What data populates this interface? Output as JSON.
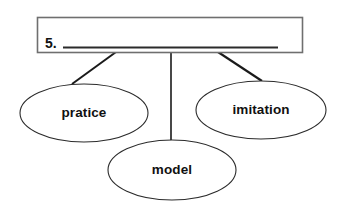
{
  "worksheet": {
    "type": "word-web-diagram",
    "background_color": "#ffffff",
    "line_color": "#1a1a1a",
    "box_border_color": "#6f6f6f",
    "text_color": "#111111",
    "prompt": {
      "number": "5.",
      "answer_blank_value": "",
      "answer_blank_placeholder": "",
      "box_label": "answer-box"
    },
    "nodes": [
      {
        "id": "node-left",
        "label": "pratice",
        "cx": 84,
        "cy": 113,
        "rx": 64,
        "ry": 29
      },
      {
        "id": "node-right",
        "label": "imitation",
        "cx": 261,
        "cy": 110,
        "rx": 65,
        "ry": 29
      },
      {
        "id": "node-bottom",
        "label": "model",
        "cx": 172,
        "cy": 170,
        "rx": 64,
        "ry": 30
      }
    ],
    "connectors": [
      {
        "id": "connector-left",
        "x1": 116,
        "y1": 52,
        "x2": 72,
        "y2": 84
      },
      {
        "id": "connector-middle",
        "x1": 171,
        "y1": 52,
        "x2": 171,
        "y2": 141
      },
      {
        "id": "connector-right",
        "x1": 218,
        "y1": 52,
        "x2": 262,
        "y2": 81
      }
    ]
  }
}
